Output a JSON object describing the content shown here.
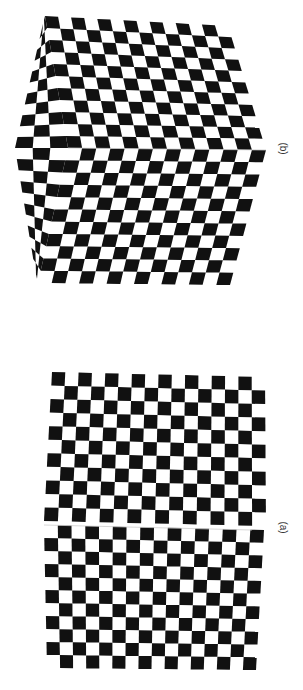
{
  "figure": {
    "orientation": "rotated-90",
    "colors": {
      "dark": "#111111",
      "light": "#ffffff",
      "seam": "#cccccc"
    },
    "panels": [
      {
        "id": "b",
        "label": "(b)",
        "description": "Checkerboard folded into a convex corner (cube-like edge), with a compressed side face",
        "rows": 22,
        "cols": 16
      },
      {
        "id": "a",
        "label": "(a)",
        "description": "Nearly planar checkerboard with a slight fold seam across the middle",
        "rows": 22,
        "cols": 16
      }
    ]
  }
}
